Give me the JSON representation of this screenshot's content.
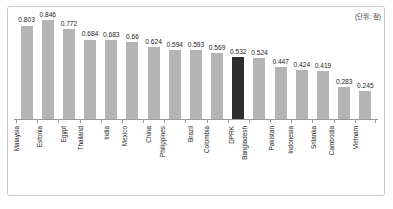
{
  "unit_note": "(단위: 점)",
  "chart_data": {
    "type": "bar",
    "title": "",
    "xlabel": "",
    "ylabel": "",
    "ylim": [
      0,
      0.85
    ],
    "grid": false,
    "legend": "none",
    "unit": "(단위: 점)",
    "highlight_category": "DPRK",
    "colors": {
      "bar": "#b4b4b4",
      "highlight_bar": "#2e2e2e",
      "axis": "#9a9a9a",
      "frame": "#c9c9c9",
      "text": "#1c1c1c"
    },
    "categories": [
      "Malaysia",
      "Estonia",
      "Egypt",
      "Thailand",
      "India",
      "Mexico",
      "China",
      "Philippines",
      "Brazil",
      "Colombia",
      "DPRK",
      "Bangladesh",
      "Pakistan",
      "Indonesia",
      "Srilanka",
      "Cambodia",
      "Vietnam"
    ],
    "values": [
      0.803,
      0.846,
      0.772,
      0.684,
      0.683,
      0.66,
      0.624,
      0.594,
      0.593,
      0.569,
      0.532,
      0.524,
      0.447,
      0.424,
      0.419,
      0.283,
      0.245
    ],
    "value_labels": [
      "0.803",
      "0.846",
      "0.772",
      "0.684",
      "0.683",
      "0.66",
      "0.624",
      "0.594",
      "0.593",
      "0.569",
      "0.532",
      "0.524",
      "0.447",
      "0.424",
      "0.419",
      "0.283",
      "0.245"
    ],
    "bars": [
      {
        "category": "Malaysia",
        "value": 0.803,
        "label": "0.803",
        "highlight": false
      },
      {
        "category": "Estonia",
        "value": 0.846,
        "label": "0.846",
        "highlight": false
      },
      {
        "category": "Egypt",
        "value": 0.772,
        "label": "0.772",
        "highlight": false
      },
      {
        "category": "Thailand",
        "value": 0.684,
        "label": "0.684",
        "highlight": false
      },
      {
        "category": "India",
        "value": 0.683,
        "label": "0.683",
        "highlight": false
      },
      {
        "category": "Mexico",
        "value": 0.66,
        "label": "0.66",
        "highlight": false
      },
      {
        "category": "China",
        "value": 0.624,
        "label": "0.624",
        "highlight": false
      },
      {
        "category": "Philippines",
        "value": 0.594,
        "label": "0.594",
        "highlight": false
      },
      {
        "category": "Brazil",
        "value": 0.593,
        "label": "0.593",
        "highlight": false
      },
      {
        "category": "Colombia",
        "value": 0.569,
        "label": "0.569",
        "highlight": false
      },
      {
        "category": "DPRK",
        "value": 0.532,
        "label": "0.532",
        "highlight": true
      },
      {
        "category": "Bangladesh",
        "value": 0.524,
        "label": "0.524",
        "highlight": false
      },
      {
        "category": "Pakistan",
        "value": 0.447,
        "label": "0.447",
        "highlight": false
      },
      {
        "category": "Indonesia",
        "value": 0.424,
        "label": "0.424",
        "highlight": false
      },
      {
        "category": "Srilanka",
        "value": 0.419,
        "label": "0.419",
        "highlight": false
      },
      {
        "category": "Cambodia",
        "value": 0.283,
        "label": "0.283",
        "highlight": false
      },
      {
        "category": "Vietnam",
        "value": 0.245,
        "label": "0.245",
        "highlight": false
      }
    ]
  }
}
